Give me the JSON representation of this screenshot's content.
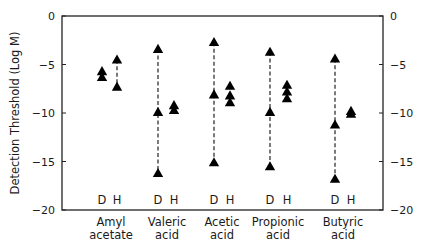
{
  "chart_data": {
    "type": "scatter",
    "title": "",
    "xlabel": "",
    "ylabel": "Detection Threshold (Log M)",
    "ylim": [
      -20,
      0
    ],
    "yticks": [
      0,
      -5,
      -10,
      -15,
      -20
    ],
    "ytick_labels": [
      "0",
      "−5",
      "−10",
      "−15",
      "−20"
    ],
    "right_axis_mirror": true,
    "grid": false,
    "legend": null,
    "marker": "filled-triangle",
    "group_labels": [
      "D",
      "H"
    ],
    "categories": [
      {
        "label_line1": "Amyl",
        "label_line2": "acetate"
      },
      {
        "label_line1": "Valeric",
        "label_line2": "acid"
      },
      {
        "label_line1": "Acetic",
        "label_line2": "acid"
      },
      {
        "label_line1": "Propionic",
        "label_line2": "acid"
      },
      {
        "label_line1": "Butyric",
        "label_line2": "acid"
      }
    ],
    "series": [
      {
        "name": "D",
        "values": [
          [
            -5.7,
            -6.3
          ],
          [
            -3.4,
            -9.9,
            -16.2
          ],
          [
            -2.7,
            -8.1,
            -15.1
          ],
          [
            -3.7,
            -9.9,
            -15.5
          ],
          [
            -4.4,
            -11.2,
            -16.8
          ]
        ],
        "dashed_range": [
          false,
          true,
          true,
          true,
          true
        ]
      },
      {
        "name": "H",
        "values": [
          [
            -4.5,
            -7.3
          ],
          [
            -9.2,
            -9.7
          ],
          [
            -7.2,
            -8.2,
            -8.9
          ],
          [
            -7.1,
            -7.8,
            -8.5
          ],
          [
            -9.8,
            -10.1
          ]
        ],
        "dashed_range": [
          true,
          false,
          false,
          false,
          false
        ]
      }
    ]
  }
}
